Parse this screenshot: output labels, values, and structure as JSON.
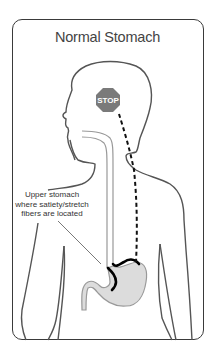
{
  "figure": {
    "title": "Normal Stomach",
    "stop_sign": {
      "label": "STOP",
      "color": "#7a7a7a"
    },
    "annotation": {
      "lines": [
        "Upper stomach",
        "where satiety/stretch",
        "fibers are located"
      ]
    },
    "colors": {
      "outline": "#555555",
      "frame": "#3a3a3a",
      "nerve_path": "#111111",
      "stomach_fill": "#dcdcdc",
      "stretch_fibers": "#000000"
    }
  }
}
